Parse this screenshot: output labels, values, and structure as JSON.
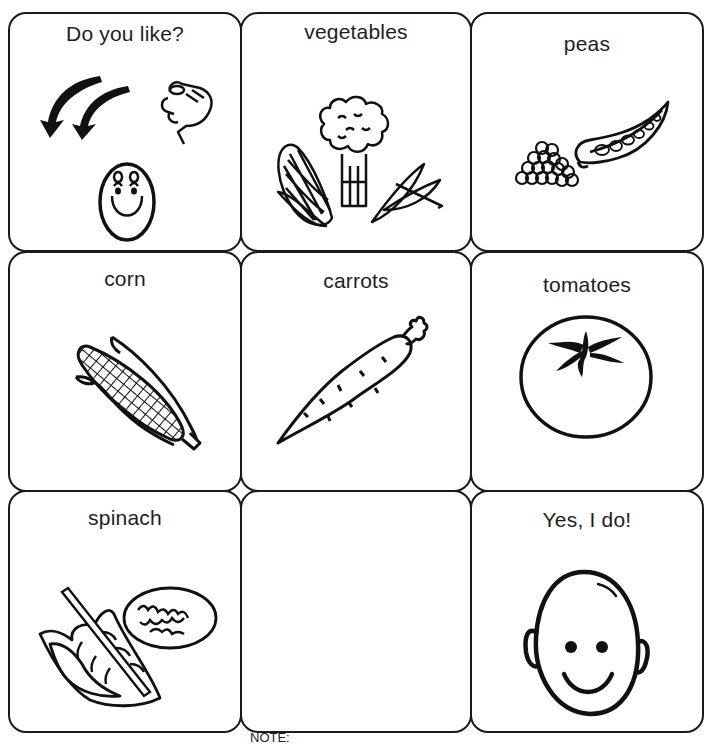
{
  "board": {
    "cards": [
      {
        "label": "Do you like?",
        "icon": "question-arrows-pointing-hand-egg-face-icon"
      },
      {
        "label": "vegetables",
        "icon": "vegetables-corn-broccoli-beans-icon"
      },
      {
        "label": "peas",
        "icon": "peas-pod-icon"
      },
      {
        "label": "corn",
        "icon": "corn-cob-icon"
      },
      {
        "label": "carrots",
        "icon": "carrot-icon"
      },
      {
        "label": "tomatoes",
        "icon": "tomato-icon"
      },
      {
        "label": "spinach",
        "icon": "spinach-leaves-icon"
      },
      {
        "label": "",
        "icon": ""
      },
      {
        "label": "Yes, I do!",
        "icon": "smiling-face-icon"
      }
    ]
  },
  "footer": {
    "note": "NOTE:"
  },
  "colors": {
    "ink": "#1a1a1a",
    "paper": "#ffffff"
  }
}
